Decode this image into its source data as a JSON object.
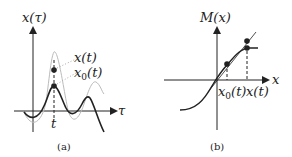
{
  "panel_a": {
    "y_label": "x(τ)",
    "x_label": "τ",
    "tick_label": "t",
    "legend_top": "x(t)",
    "legend_bottom_base": "x",
    "legend_bottom_sub": "0",
    "legend_bottom_tail": "(t)",
    "caption": "(a)"
  },
  "panel_b": {
    "y_label": "M(x)",
    "x_label": "x",
    "tick1_base": "x",
    "tick1_sub": "0",
    "tick1_tail": "(t)",
    "tick2": "x(t)",
    "caption": "(b)"
  },
  "colors": {
    "ink": "#222222",
    "light_curve": "#bbbbbb",
    "dotted": "#aaaaaa"
  }
}
